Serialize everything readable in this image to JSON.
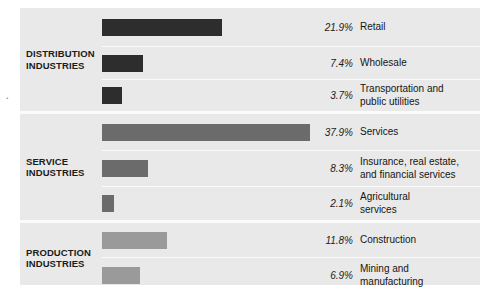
{
  "scan_artifact": ".",
  "chart_data": {
    "type": "bar",
    "title": "",
    "subtitle": "",
    "xlabel": "",
    "ylabel": "",
    "orientation": "horizontal",
    "grid": false,
    "legend": "none",
    "value_suffix": "%",
    "xlim": [
      0,
      40
    ],
    "categories": [
      "Retail",
      "Wholesale",
      "Transportation and public utilities",
      "Services",
      "Insurance, real estate, and financial services",
      "Agricultural services",
      "Construction",
      "Mining and manufacturing"
    ],
    "values": [
      21.9,
      7.4,
      3.7,
      37.9,
      8.3,
      2.1,
      11.8,
      6.9
    ],
    "groups": [
      {
        "name": "DISTRIBUTION INDUSTRIES",
        "color": "#2d2d2d",
        "categories": [
          "Retail",
          "Wholesale",
          "Transportation and public utilities"
        ],
        "values": [
          21.9,
          7.4,
          3.7
        ]
      },
      {
        "name": "SERVICE INDUSTRIES",
        "color": "#6b6b6b",
        "categories": [
          "Services",
          "Insurance, real estate, and financial services",
          "Agricultural services"
        ],
        "values": [
          37.9,
          8.3,
          2.1
        ]
      },
      {
        "name": "PRODUCTION INDUSTRIES",
        "color": "#9a9a9a",
        "categories": [
          "Construction",
          "Mining and manufacturing"
        ],
        "values": [
          11.8,
          6.9
        ]
      }
    ]
  },
  "groups": [
    {
      "label": "DISTRIBUTION\nINDUSTRIES",
      "color": "#2d2d2d",
      "rows": [
        {
          "pct": "21.9%",
          "name": "Retail",
          "value": 21.9,
          "height": 38
        },
        {
          "pct": "7.4%",
          "name": "Wholesale",
          "value": 7.4,
          "height": 33
        },
        {
          "pct": "3.7%",
          "name": "Transportation and\npublic utilities",
          "value": 3.7,
          "height": 32
        }
      ]
    },
    {
      "label": "SERVICE\nINDUSTRIES",
      "color": "#6b6b6b",
      "rows": [
        {
          "pct": "37.9%",
          "name": "Services",
          "value": 37.9,
          "height": 36
        },
        {
          "pct": "8.3%",
          "name": "Insurance, real estate,\nand financial services",
          "value": 8.3,
          "height": 36
        },
        {
          "pct": "2.1%",
          "name": "Agricultural\nservices",
          "value": 2.1,
          "height": 34
        }
      ]
    },
    {
      "label": "PRODUCTION\nINDUSTRIES",
      "color": "#9a9a9a",
      "rows": [
        {
          "pct": "11.8%",
          "name": "Construction",
          "value": 11.8,
          "height": 34
        },
        {
          "pct": "6.9%",
          "name": "Mining and\nmanufacturing",
          "value": 6.9,
          "height": 36
        }
      ]
    }
  ],
  "scale": {
    "px_per_percent": 5.49
  }
}
